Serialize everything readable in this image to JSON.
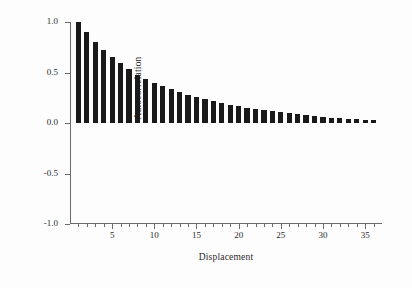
{
  "chart_data": {
    "type": "bar",
    "title": "",
    "subtitle": "",
    "xlabel": "Displacement",
    "ylabel": "Autocorrelation",
    "xlim": [
      0,
      37
    ],
    "ylim": [
      -1.0,
      1.0
    ],
    "grid": false,
    "legend": null,
    "bar_color": "#1a1a1a",
    "axis_color": "#6b6b6b",
    "background": "#ffffff",
    "baseline": 0.0,
    "categories": [
      1,
      2,
      3,
      4,
      5,
      6,
      7,
      8,
      9,
      10,
      11,
      12,
      13,
      14,
      15,
      16,
      17,
      18,
      19,
      20,
      21,
      22,
      23,
      24,
      25,
      26,
      27,
      28,
      29,
      30,
      31,
      32,
      33,
      34,
      35,
      36
    ],
    "values": [
      1.0,
      0.9,
      0.8,
      0.72,
      0.65,
      0.59,
      0.53,
      0.48,
      0.44,
      0.4,
      0.37,
      0.34,
      0.31,
      0.28,
      0.26,
      0.24,
      0.22,
      0.2,
      0.18,
      0.165,
      0.15,
      0.135,
      0.125,
      0.115,
      0.105,
      0.095,
      0.085,
      0.075,
      0.068,
      0.06,
      0.054,
      0.048,
      0.042,
      0.036,
      0.03,
      0.025
    ],
    "y_ticks": [
      {
        "value": 1.0,
        "label": "1.0"
      },
      {
        "value": 0.5,
        "label": "0.5"
      },
      {
        "value": 0.0,
        "label": "0.0"
      },
      {
        "value": -0.5,
        "label": "-0.5"
      },
      {
        "value": -1.0,
        "label": "-1.0"
      }
    ],
    "x_ticks_major": [
      {
        "value": 5,
        "label": "5"
      },
      {
        "value": 10,
        "label": "10"
      },
      {
        "value": 15,
        "label": "15"
      },
      {
        "value": 20,
        "label": "20"
      },
      {
        "value": 25,
        "label": "25"
      },
      {
        "value": 30,
        "label": "30"
      },
      {
        "value": 35,
        "label": "35"
      }
    ],
    "x_ticks_minor": [
      1,
      2,
      3,
      4,
      6,
      7,
      8,
      9,
      11,
      12,
      13,
      14,
      16,
      17,
      18,
      19,
      21,
      22,
      23,
      24,
      26,
      27,
      28,
      29,
      31,
      32,
      33,
      34,
      36
    ]
  }
}
